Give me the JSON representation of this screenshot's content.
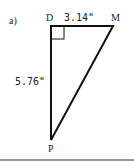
{
  "problem": {
    "label": "a)"
  },
  "triangle": {
    "vertices": {
      "D": {
        "label": "D",
        "x": 51,
        "y": 26
      },
      "M": {
        "label": "M",
        "x": 113,
        "y": 26
      },
      "P": {
        "label": "P",
        "x": 51,
        "y": 140
      }
    },
    "right_angle_at": "D",
    "sides": {
      "DM": {
        "label": "3.14\""
      },
      "DP": {
        "label": "5.76\""
      }
    }
  },
  "colors": {
    "stroke": "#111111",
    "background": "#ffffff"
  }
}
